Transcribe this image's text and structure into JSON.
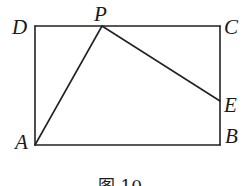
{
  "figure": {
    "caption": "图 10",
    "shape": "rectangle ABCD with segments AP and PE",
    "points": {
      "A": {
        "label": "A",
        "x": 35,
        "y": 145
      },
      "B": {
        "label": "B",
        "x": 220,
        "y": 145
      },
      "C": {
        "label": "C",
        "x": 220,
        "y": 26
      },
      "D": {
        "label": "D",
        "x": 35,
        "y": 26
      },
      "P": {
        "label": "P",
        "x": 102,
        "y": 26
      },
      "E": {
        "label": "E",
        "x": 220,
        "y": 101
      }
    },
    "segments": [
      {
        "from": "A",
        "to": "B"
      },
      {
        "from": "B",
        "to": "C"
      },
      {
        "from": "C",
        "to": "D"
      },
      {
        "from": "D",
        "to": "A"
      },
      {
        "from": "A",
        "to": "P"
      },
      {
        "from": "P",
        "to": "E"
      }
    ],
    "line_color": "#222222"
  }
}
